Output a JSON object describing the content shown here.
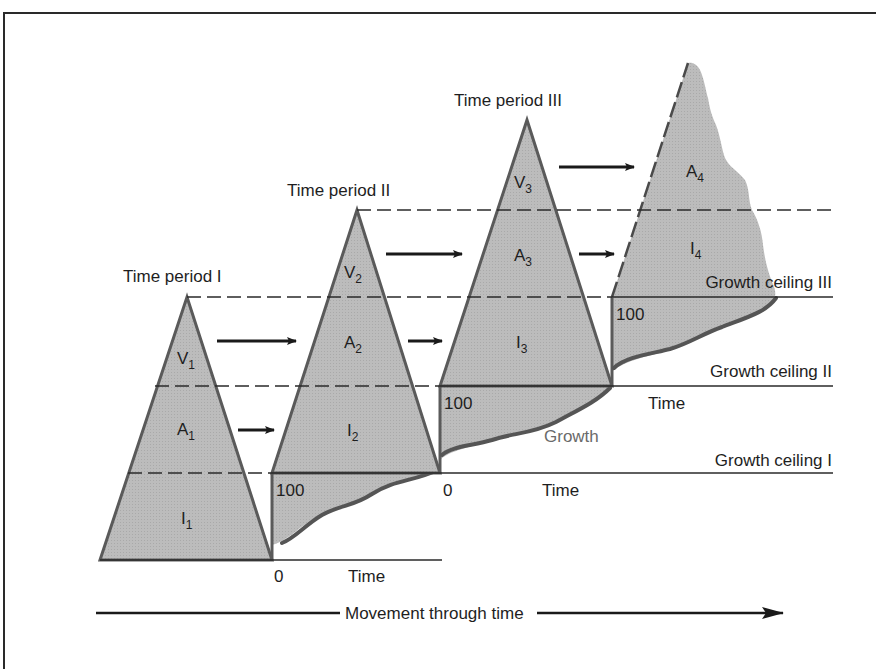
{
  "diagram": {
    "type": "growth-ceiling-staircase",
    "colors": {
      "fill": "#bdbdbd",
      "stroke": "#5a5a5a",
      "growth_curve": "#555555",
      "text": "#1e1e1e",
      "growth_label": "#6a6a6a",
      "background": "#ffffff"
    },
    "periods": [
      {
        "title": "Time period I",
        "layers": [
          {
            "letter": "V",
            "sub": "1"
          },
          {
            "letter": "A",
            "sub": "1"
          },
          {
            "letter": "I",
            "sub": "1"
          }
        ]
      },
      {
        "title": "Time period II",
        "layers": [
          {
            "letter": "V",
            "sub": "2"
          },
          {
            "letter": "A",
            "sub": "2"
          },
          {
            "letter": "I",
            "sub": "2"
          }
        ]
      },
      {
        "title": "Time period III",
        "layers": [
          {
            "letter": "V",
            "sub": "3"
          },
          {
            "letter": "A",
            "sub": "3"
          },
          {
            "letter": "I",
            "sub": "3"
          }
        ]
      },
      {
        "title": "",
        "layers": [
          {
            "letter": "A",
            "sub": "4"
          },
          {
            "letter": "I",
            "sub": "4"
          }
        ]
      }
    ],
    "ceilings": [
      {
        "label": "Growth ceiling I"
      },
      {
        "label": "Growth ceiling II"
      },
      {
        "label": "Growth ceiling III"
      }
    ],
    "axis_labels": {
      "zero": "0",
      "hundred": "100",
      "time": "Time",
      "growth": "Growth"
    },
    "footer_arrow_label": "Movement through time"
  }
}
